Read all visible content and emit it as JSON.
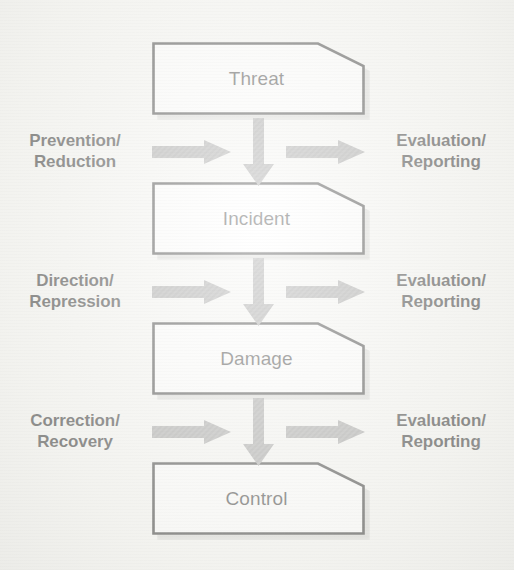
{
  "diagram": {
    "type": "flow-diagram",
    "orientation": "vertical",
    "background_color": "#f6f6f3",
    "node_fill_color": "#ffffff",
    "node_border_color": "#1a1a1a",
    "arrow_color": "#8d8d8d",
    "text_color": "#1b1b1b",
    "nodes": [
      {
        "id": "threat",
        "label": "Threat"
      },
      {
        "id": "incident",
        "label": "Incident"
      },
      {
        "id": "damage",
        "label": "Damage"
      },
      {
        "id": "control",
        "label": "Control"
      }
    ],
    "connectors": [
      {
        "id": "conn-1",
        "from": "threat",
        "to": "incident",
        "left_label_line1": "Prevention/",
        "left_label_line2": "Reduction",
        "right_label_line1": "Evaluation/",
        "right_label_line2": "Reporting"
      },
      {
        "id": "conn-2",
        "from": "incident",
        "to": "damage",
        "left_label_line1": "Direction/",
        "left_label_line2": "Repression",
        "right_label_line1": "Evaluation/",
        "right_label_line2": "Reporting"
      },
      {
        "id": "conn-3",
        "from": "damage",
        "to": "control",
        "left_label_line1": "Correction/",
        "left_label_line2": "Recovery",
        "right_label_line1": "Evaluation/",
        "right_label_line2": "Reporting"
      }
    ]
  }
}
